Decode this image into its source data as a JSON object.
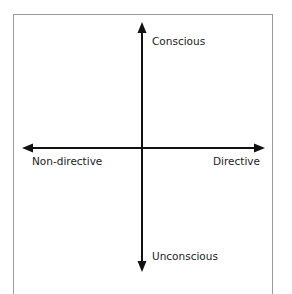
{
  "diagram": {
    "type": "quadrant-axes",
    "axes": {
      "vertical": {
        "top_label": "Conscious",
        "bottom_label": "Unconscious"
      },
      "horizontal": {
        "left_label": "Non-directive",
        "right_label": "Directive"
      }
    },
    "colors": {
      "axis": "#111111",
      "frame": "#9a9a9a",
      "text": "#222222"
    }
  }
}
